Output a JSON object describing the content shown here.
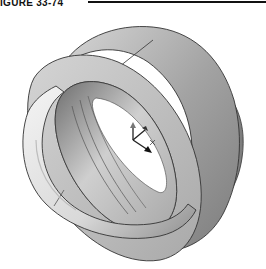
{
  "header": {
    "caption": "IGURE 33-74"
  },
  "figure": {
    "triad_axes": [
      "x",
      "y",
      "z"
    ],
    "colors": {
      "background": "#ffffff",
      "ring_outer": "#9a9a9a",
      "ring_face": "#c8c8c8",
      "torus_light": "#eeeeee",
      "torus_shadow": "#8c8c8c",
      "edge": "#333333",
      "inner_bore": "#ffffff"
    }
  }
}
